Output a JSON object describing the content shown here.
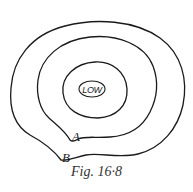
{
  "figure": {
    "caption": "Fig. 16·8",
    "center_label": "LOW",
    "point_labels": {
      "a": "A",
      "b": "B"
    },
    "contours": [
      {
        "name": "low-ellipse",
        "level": "innermost"
      },
      {
        "name": "inner-contour",
        "level": 1
      },
      {
        "name": "middle-contour",
        "level": 2,
        "marked_point": "A"
      },
      {
        "name": "outer-contour",
        "level": 3,
        "marked_point": "B"
      }
    ],
    "colors": {
      "line": "#1a1a1a",
      "background": "#ffffff",
      "caption": "#333333"
    }
  }
}
